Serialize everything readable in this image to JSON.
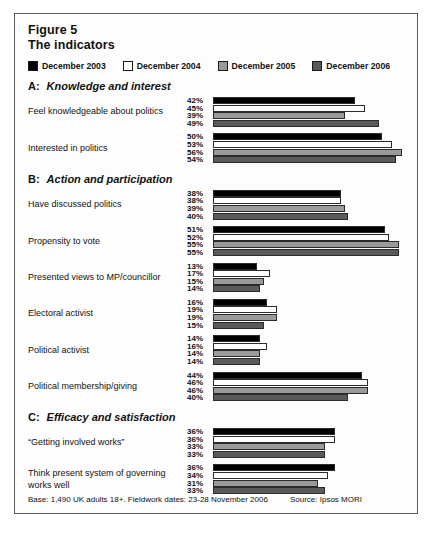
{
  "figure": {
    "number_label": "Figure 5",
    "subtitle": "The indicators"
  },
  "legend": {
    "items": [
      {
        "label": "December 2003",
        "color": "#000000"
      },
      {
        "label": "December 2004",
        "color": "#ffffff"
      },
      {
        "label": "December 2005",
        "color": "#9a9a9a"
      },
      {
        "label": "December 2006",
        "color": "#5a5a5a"
      }
    ]
  },
  "sections": [
    {
      "letter": "A:",
      "title": "Knowledge and interest",
      "rows": [
        {
          "label": "Feel knowledgeable about politics",
          "values": [
            42,
            45,
            39,
            49
          ],
          "labels": [
            "42%",
            "45%",
            "39%",
            "49%"
          ]
        },
        {
          "label": "Interested in politics",
          "values": [
            50,
            53,
            56,
            54
          ],
          "labels": [
            "50%",
            "53%",
            "56%",
            "54%"
          ]
        }
      ]
    },
    {
      "letter": "B:",
      "title": "Action and participation",
      "rows": [
        {
          "label": "Have discussed politics",
          "values": [
            38,
            38,
            39,
            40
          ],
          "labels": [
            "38%",
            "38%",
            "39%",
            "40%"
          ]
        },
        {
          "label": "Propensity to vote",
          "values": [
            51,
            52,
            55,
            55
          ],
          "labels": [
            "51%",
            "52%",
            "55%",
            "55%"
          ]
        },
        {
          "label": "Presented views to MP/councillor",
          "values": [
            13,
            17,
            15,
            14
          ],
          "labels": [
            "13%",
            "17%",
            "15%",
            "14%"
          ]
        },
        {
          "label": "Electoral activist",
          "values": [
            16,
            19,
            19,
            15
          ],
          "labels": [
            "16%",
            "19%",
            "19%",
            "15%"
          ]
        },
        {
          "label": "Political activist",
          "values": [
            14,
            16,
            14,
            14
          ],
          "labels": [
            "14%",
            "16%",
            "14%",
            "14%"
          ]
        },
        {
          "label": "Political membership/giving",
          "values": [
            44,
            46,
            46,
            40
          ],
          "labels": [
            "44%",
            "46%",
            "46%",
            "40%"
          ]
        }
      ]
    },
    {
      "letter": "C:",
      "title": "Efficacy and satisfaction",
      "rows": [
        {
          "label": "“Getting involved works”",
          "values": [
            36,
            36,
            33,
            33
          ],
          "labels": [
            "36%",
            "36%",
            "33%",
            "33%"
          ]
        },
        {
          "label": "Think present system of governing works well",
          "values": [
            36,
            34,
            31,
            33
          ],
          "labels": [
            "36%",
            "34%",
            "31%",
            "33%"
          ]
        }
      ]
    }
  ],
  "footer": {
    "note": "Base: 1,490 UK adults 18+. Fieldwork dates: 23-28 November 2006",
    "source": "Source: Ipsos MORI"
  },
  "chart_data": {
    "type": "bar",
    "orientation": "horizontal",
    "xlabel": "",
    "ylabel": "",
    "xlim": [
      0,
      60
    ],
    "grid": false,
    "legend_position": "top",
    "series": [
      {
        "name": "December 2003",
        "color": "#000000",
        "values": [
          42,
          50,
          38,
          51,
          13,
          16,
          14,
          44,
          36,
          36
        ]
      },
      {
        "name": "December 2004",
        "color": "#ffffff",
        "values": [
          45,
          53,
          38,
          52,
          17,
          19,
          16,
          46,
          36,
          34
        ]
      },
      {
        "name": "December 2005",
        "color": "#9a9a9a",
        "values": [
          39,
          56,
          39,
          55,
          15,
          19,
          14,
          46,
          33,
          31
        ]
      },
      {
        "name": "December 2006",
        "color": "#5a5a5a",
        "values": [
          49,
          54,
          40,
          55,
          14,
          15,
          14,
          40,
          33,
          33
        ]
      }
    ],
    "categories": [
      "Feel knowledgeable about politics",
      "Interested in politics",
      "Have discussed politics",
      "Propensity to vote",
      "Presented views to MP/councillor",
      "Electoral activist",
      "Political activist",
      "Political membership/giving",
      "“Getting involved works”",
      "Think present system of governing works well"
    ],
    "groups": [
      {
        "name": "A: Knowledge and interest",
        "categories": [
          0,
          1
        ]
      },
      {
        "name": "B: Action and participation",
        "categories": [
          2,
          3,
          4,
          5,
          6,
          7
        ]
      },
      {
        "name": "C: Efficacy and satisfaction",
        "categories": [
          8,
          9
        ]
      }
    ],
    "units": "percent",
    "base_note": "Base: 1,490 UK adults 18+. Fieldwork dates: 23-28 November 2006",
    "source": "Ipsos MORI"
  }
}
